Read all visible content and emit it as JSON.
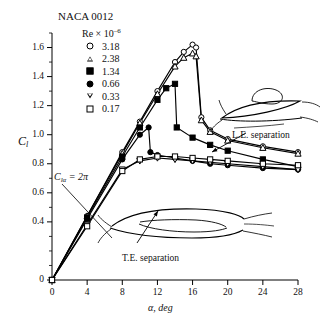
{
  "title": "NACA 0012",
  "legend": {
    "header": "Re × 10",
    "header_exp": "–6",
    "entries": [
      {
        "marker": "open-circle",
        "value": "3.18"
      },
      {
        "marker": "open-triangle-up",
        "value": "2.38"
      },
      {
        "marker": "filled-square",
        "value": "1.34"
      },
      {
        "marker": "filled-circle",
        "value": "0.66"
      },
      {
        "marker": "open-triangle-down",
        "value": "0.33"
      },
      {
        "marker": "open-square",
        "value": "0.17"
      }
    ]
  },
  "axes": {
    "ylabel": "C",
    "ylabel_sub": "l",
    "xlabel": "α, deg",
    "yticks": [
      "0",
      "0.4",
      "0.6",
      "0.8",
      "1.0",
      "1.2",
      "1.4",
      "1.6"
    ],
    "xticks": [
      "0",
      "4",
      "8",
      "12",
      "16",
      "20",
      "24",
      "28"
    ]
  },
  "annotations": {
    "le_separation": "L.E. separation",
    "te_separation": "T.E. separation",
    "cl_alpha": "C",
    "cl_alpha_sub": "lα",
    "cl_alpha_rest": " = 2π"
  },
  "chart_data": {
    "type": "line",
    "title": "NACA 0012",
    "xlabel": "α, deg",
    "ylabel": "C_l",
    "xlim": [
      0,
      28
    ],
    "ylim": [
      0,
      1.7
    ],
    "grid": false,
    "legend_position": "upper-left",
    "legend_title": "Re × 10^-6",
    "series": [
      {
        "name": "3.18",
        "marker": "open-circle",
        "x": [
          0,
          4,
          8,
          10,
          12,
          14,
          15,
          16,
          16.4,
          17,
          18,
          20,
          24,
          28
        ],
        "y": [
          0,
          0.44,
          0.88,
          1.09,
          1.3,
          1.5,
          1.57,
          1.62,
          1.6,
          1.12,
          1.03,
          0.97,
          0.92,
          0.88
        ]
      },
      {
        "name": "2.38",
        "marker": "open-triangle-up",
        "x": [
          0,
          4,
          8,
          10,
          12,
          14,
          15,
          16,
          16.4,
          17,
          18,
          20,
          24,
          28
        ],
        "y": [
          0,
          0.44,
          0.87,
          1.08,
          1.28,
          1.47,
          1.53,
          1.56,
          1.54,
          1.1,
          1.02,
          0.96,
          0.91,
          0.87
        ]
      },
      {
        "name": "1.34",
        "marker": "filled-square",
        "x": [
          0,
          4,
          8,
          10,
          12,
          13,
          14,
          14.2,
          16,
          18,
          20,
          24,
          28
        ],
        "y": [
          0,
          0.43,
          0.85,
          1.05,
          1.24,
          1.32,
          1.35,
          1.05,
          0.98,
          0.93,
          0.89,
          0.83,
          0.78
        ]
      },
      {
        "name": "0.66",
        "marker": "filled-circle",
        "x": [
          0,
          4,
          8,
          10,
          11,
          11.2,
          12,
          14,
          16,
          18,
          20,
          24,
          28
        ],
        "y": [
          0,
          0.42,
          0.83,
          1.0,
          1.05,
          0.88,
          0.86,
          0.84,
          0.82,
          0.8,
          0.79,
          0.77,
          0.76
        ]
      },
      {
        "name": "0.33",
        "marker": "open-triangle-down",
        "x": [
          0,
          4,
          8,
          10,
          12,
          14,
          16,
          18,
          20,
          24,
          28
        ],
        "y": [
          0,
          0.38,
          0.76,
          0.82,
          0.84,
          0.83,
          0.82,
          0.81,
          0.8,
          0.78,
          0.76
        ]
      },
      {
        "name": "0.17",
        "marker": "open-square",
        "x": [
          0,
          4,
          8,
          10,
          12,
          14,
          16,
          18,
          20,
          24,
          28
        ],
        "y": [
          0,
          0.37,
          0.75,
          0.83,
          0.85,
          0.85,
          0.84,
          0.83,
          0.82,
          0.8,
          0.79
        ]
      }
    ],
    "annotations": [
      {
        "text": "L.E. separation",
        "x": 22,
        "y": 1.15
      },
      {
        "text": "T.E. separation",
        "x": 10,
        "y": 0.3
      },
      {
        "text": "C_lα = 2π",
        "x": 3,
        "y": 0.95
      }
    ]
  }
}
